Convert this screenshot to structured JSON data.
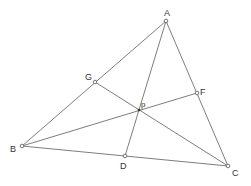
{
  "diagram": {
    "points": {
      "A": {
        "label": "A"
      },
      "B": {
        "label": "B"
      },
      "C": {
        "label": "C"
      },
      "D": {
        "label": "D"
      },
      "F": {
        "label": "F"
      },
      "G": {
        "label": "G"
      },
      "p": {
        "label": "p"
      }
    },
    "segments": [
      {
        "from": "A",
        "to": "B"
      },
      {
        "from": "B",
        "to": "C"
      },
      {
        "from": "C",
        "to": "A"
      },
      {
        "from": "A",
        "to": "D"
      },
      {
        "from": "B",
        "to": "F"
      },
      {
        "from": "C",
        "to": "G"
      }
    ],
    "colors": {
      "line": "#6e6e6e",
      "text": "#333333",
      "background": "#ffffff"
    }
  }
}
